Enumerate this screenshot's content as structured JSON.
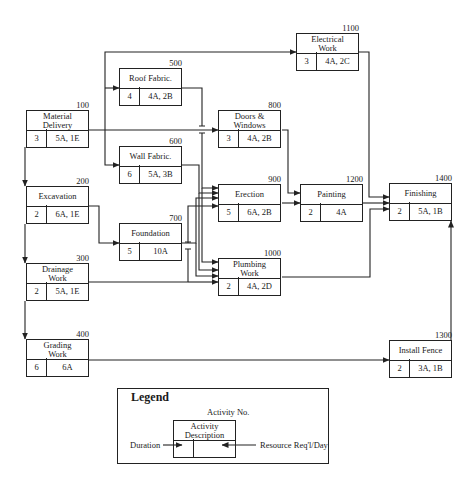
{
  "diagram": {
    "type": "activity-on-node network",
    "activities": [
      {
        "id": "100",
        "description_lines": [
          "Material",
          "Delivery"
        ],
        "duration": "3",
        "resources": "5A, 1E"
      },
      {
        "id": "200",
        "description_lines": [
          "Excavation"
        ],
        "duration": "2",
        "resources": "6A, 1E"
      },
      {
        "id": "300",
        "description_lines": [
          "Drainage",
          "Work"
        ],
        "duration": "2",
        "resources": "5A, 1E"
      },
      {
        "id": "400",
        "description_lines": [
          "Grading",
          "Work"
        ],
        "duration": "6",
        "resources": "6A"
      },
      {
        "id": "500",
        "description_lines": [
          "Roof Fabric."
        ],
        "duration": "4",
        "resources": "4A, 2B"
      },
      {
        "id": "600",
        "description_lines": [
          "Wall Fabric."
        ],
        "duration": "6",
        "resources": "5A, 3B"
      },
      {
        "id": "700",
        "description_lines": [
          "Foundation"
        ],
        "duration": "5",
        "resources": "10A"
      },
      {
        "id": "800",
        "description_lines": [
          "Doors &",
          "Windows"
        ],
        "duration": "3",
        "resources": "4A, 2B"
      },
      {
        "id": "900",
        "description_lines": [
          "Erection"
        ],
        "duration": "5",
        "resources": "6A, 2B"
      },
      {
        "id": "1000",
        "description_lines": [
          "Plumbing",
          "Work"
        ],
        "duration": "2",
        "resources": "4A, 2D"
      },
      {
        "id": "1100",
        "description_lines": [
          "Electrical",
          "Work"
        ],
        "duration": "3",
        "resources": "4A, 2C"
      },
      {
        "id": "1200",
        "description_lines": [
          "Painting"
        ],
        "duration": "2",
        "resources": "4A"
      },
      {
        "id": "1300",
        "description_lines": [
          "Install Fence"
        ],
        "duration": "2",
        "resources": "3A, 1B"
      },
      {
        "id": "1400",
        "description_lines": [
          "Finishing"
        ],
        "duration": "2",
        "resources": "5A, 1B"
      }
    ],
    "dependencies": [
      [
        "100",
        "200"
      ],
      [
        "100",
        "300"
      ],
      [
        "100",
        "400"
      ],
      [
        "100",
        "500"
      ],
      [
        "100",
        "600"
      ],
      [
        "100",
        "800"
      ],
      [
        "100",
        "1100"
      ],
      [
        "200",
        "700"
      ],
      [
        "300",
        "1000"
      ],
      [
        "400",
        "1300"
      ],
      [
        "500",
        "900"
      ],
      [
        "500",
        "1000"
      ],
      [
        "600",
        "900"
      ],
      [
        "600",
        "1000"
      ],
      [
        "700",
        "900"
      ],
      [
        "700",
        "1000"
      ],
      [
        "800",
        "1200"
      ],
      [
        "900",
        "1200"
      ],
      [
        "1000",
        "1400"
      ],
      [
        "1100",
        "1400"
      ],
      [
        "1200",
        "1400"
      ],
      [
        "1300",
        "1400"
      ]
    ]
  },
  "legend": {
    "title": "Legend",
    "activity_no": "Activity No.",
    "activity_description_lines": [
      "Activity",
      "Description"
    ],
    "duration_label": "Duration",
    "resource_label": "Resource  Req'l/Day"
  }
}
